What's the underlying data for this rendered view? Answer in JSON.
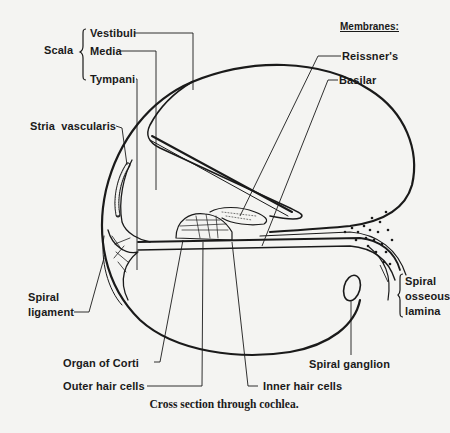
{
  "figure": {
    "caption": "Cross section through cochlea.",
    "scala_group": {
      "label": "Scala",
      "items": [
        "Vestibuli",
        "Media",
        "Tympani"
      ]
    },
    "membranes_group": {
      "header": "Membranes:",
      "items": [
        "Reissner's",
        "Basilar"
      ]
    },
    "labels": {
      "stria_vascularis": "Stria  vascularis",
      "spiral_ligament_line1": "Spiral",
      "spiral_ligament_line2": "ligament",
      "organ_of_corti": "Organ of Corti",
      "outer_hair_cells": "Outer hair cells",
      "inner_hair_cells": "Inner hair cells",
      "spiral_ganglion": "Spiral ganglion",
      "spiral_osseous_lamina_line1": "Spiral",
      "spiral_osseous_lamina_line2": "osseous",
      "spiral_osseous_lamina_line3": "lamina"
    },
    "colors": {
      "background": "#f4f4f2",
      "ink": "#1a1a1a"
    }
  }
}
